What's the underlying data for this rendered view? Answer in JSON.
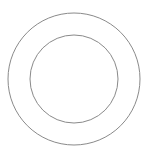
{
  "diagram": {
    "type": "concentric-circles",
    "canvas": {
      "width": 147,
      "height": 158,
      "background": "#ffffff"
    },
    "stroke_color": "#8a8a8a",
    "shapes": [
      {
        "name": "outer-circle",
        "cx": 74,
        "cy": 79,
        "r": 66
      },
      {
        "name": "inner-circle",
        "cx": 74,
        "cy": 79,
        "r": 44
      }
    ]
  }
}
